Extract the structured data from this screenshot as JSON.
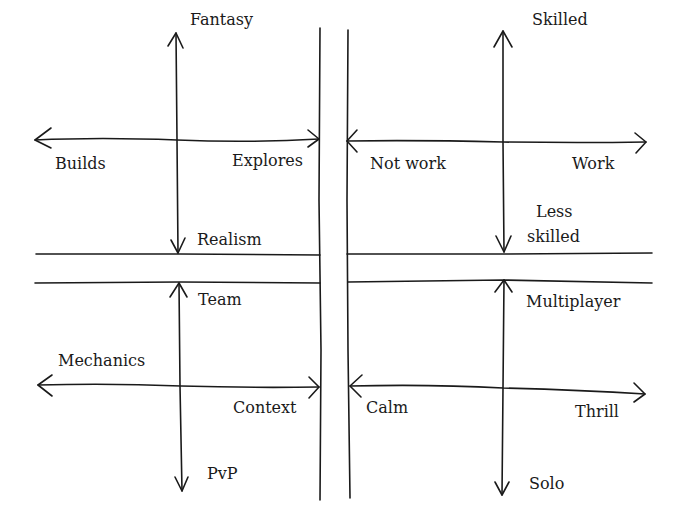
{
  "diagram": {
    "title": "",
    "ink_color": "#1a1a1a",
    "background": "#ffffff",
    "quadrants": [
      {
        "id": "top-left",
        "vertical_axis": {
          "top": "Fantasy",
          "bottom": "Realism"
        },
        "horizontal_axis": {
          "left": "Builds",
          "right": "Explores"
        }
      },
      {
        "id": "top-right",
        "vertical_axis": {
          "top": "Skilled",
          "bottom": "Less\nskilled",
          "bottom_line1": "Less",
          "bottom_line2": "skilled"
        },
        "horizontal_axis": {
          "left": "Not work",
          "right": "Work"
        }
      },
      {
        "id": "bottom-left",
        "vertical_axis": {
          "top": "Team",
          "bottom": "PvP"
        },
        "horizontal_axis": {
          "left": "Mechanics",
          "right": "Context"
        }
      },
      {
        "id": "bottom-right",
        "vertical_axis": {
          "top": "Multiplayer",
          "bottom": "Solo"
        },
        "horizontal_axis": {
          "left": "Calm",
          "right": "Thrill"
        }
      }
    ]
  }
}
